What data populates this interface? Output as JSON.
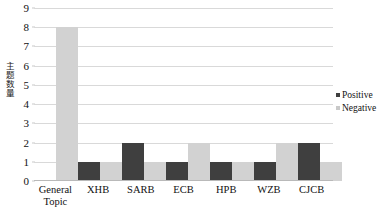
{
  "chart_data": {
    "type": "bar",
    "title": "",
    "xlabel": "",
    "ylabel": "主题数量",
    "ylim": [
      0,
      9
    ],
    "ytick_step": 1,
    "yticks": [
      0,
      1,
      2,
      3,
      4,
      5,
      6,
      7,
      8,
      9
    ],
    "grid": true,
    "legend_position": "right",
    "categories": [
      "General Topic",
      "XHB",
      "SARB",
      "ECB",
      "HPB",
      "WZB",
      "CJCB"
    ],
    "series": [
      {
        "name": "Positive",
        "color": "#3f3f3f",
        "values": [
          0,
          1,
          2,
          1,
          1,
          1,
          2
        ]
      },
      {
        "name": "Negative",
        "color": "#d2d2d2",
        "values": [
          8,
          1,
          1,
          2,
          1,
          2,
          1
        ]
      }
    ]
  },
  "legend": {
    "items": [
      {
        "label": "Positive",
        "marker": "square-dark"
      },
      {
        "label": "Negative",
        "marker": "square-light"
      }
    ]
  },
  "axis": {
    "y_title": "主题数量"
  }
}
